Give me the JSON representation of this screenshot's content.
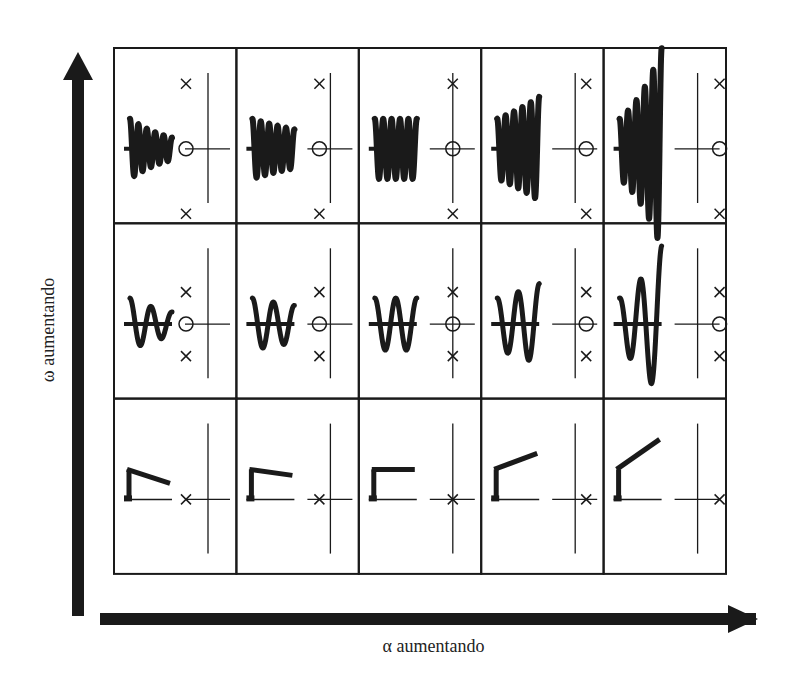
{
  "diagram": {
    "type": "grid-of-step-responses-and-pole-zero-plots",
    "rows": 3,
    "cols": 5,
    "x_axis_label": "α aumentando",
    "y_axis_label": "ω aumentando",
    "x_axis_direction": "right",
    "y_axis_direction": "up",
    "colors": {
      "ink": "#1a1a1a",
      "line": "#333333",
      "background": "#ffffff"
    }
  },
  "grid": {
    "left": 114,
    "top": 48,
    "cell_w": 122.4,
    "cell_h": 175.3,
    "rows": [
      {
        "name": "high-omega",
        "description": "fast oscillation, complex poles far from real axis, zero near origin",
        "cells": [
          {
            "zero_x": -1.0,
            "pole_x": -1.0,
            "pole_y": 1.0,
            "response": "oscillating",
            "cycles": 5,
            "growth": -0.45
          },
          {
            "zero_x": -0.5,
            "pole_x": -0.5,
            "pole_y": 1.0,
            "response": "oscillating",
            "cycles": 5,
            "growth": -0.2
          },
          {
            "zero_x": 0.0,
            "pole_x": 0.0,
            "pole_y": 1.0,
            "response": "oscillating",
            "cycles": 5,
            "growth": 0.0
          },
          {
            "zero_x": 0.5,
            "pole_x": 0.5,
            "pole_y": 1.0,
            "response": "oscillating",
            "cycles": 5,
            "growth": 0.25
          },
          {
            "zero_x": 1.0,
            "pole_x": 1.0,
            "pole_y": 1.0,
            "response": "oscillating",
            "cycles": 5,
            "growth": 0.55
          }
        ]
      },
      {
        "name": "mid-omega",
        "description": "slower oscillation, complex poles closer to real axis",
        "cells": [
          {
            "zero_x": -1.0,
            "pole_x": -1.0,
            "pole_y": 0.5,
            "response": "oscillating",
            "cycles": 2,
            "growth": -0.35
          },
          {
            "zero_x": -0.5,
            "pole_x": -0.5,
            "pole_y": 0.5,
            "response": "oscillating",
            "cycles": 2,
            "growth": -0.15
          },
          {
            "zero_x": 0.0,
            "pole_x": 0.0,
            "pole_y": 0.5,
            "response": "oscillating",
            "cycles": 2,
            "growth": 0.0
          },
          {
            "zero_x": 0.5,
            "pole_x": 0.5,
            "pole_y": 0.5,
            "response": "oscillating",
            "cycles": 2,
            "growth": 0.2
          },
          {
            "zero_x": 1.0,
            "pole_x": 1.0,
            "pole_y": 0.5,
            "response": "oscillating",
            "cycles": 2,
            "growth": 0.5
          }
        ]
      },
      {
        "name": "zero-omega",
        "description": "real pole, exponential response",
        "cells": [
          {
            "pole_x": -1.0,
            "pole_y": 0.0,
            "response": "exponential",
            "slope": 0.35
          },
          {
            "pole_x": -0.5,
            "pole_y": 0.0,
            "response": "exponential",
            "slope": 0.15
          },
          {
            "pole_x": 0.0,
            "pole_y": 0.0,
            "response": "exponential",
            "slope": 0.0
          },
          {
            "pole_x": 0.5,
            "pole_y": 0.0,
            "response": "exponential",
            "slope": -0.3
          },
          {
            "pole_x": 1.0,
            "pole_y": 0.0,
            "response": "exponential",
            "slope": -0.65
          }
        ]
      }
    ]
  }
}
